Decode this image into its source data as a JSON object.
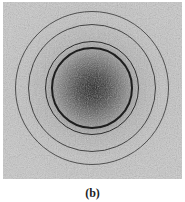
{
  "figure": {
    "panel_label": "(b)",
    "center": {
      "x": 92,
      "y": 88
    },
    "rings": [
      {
        "name": "ring-1",
        "radius": 41,
        "width": 2.2,
        "color": "#1e1e1e"
      },
      {
        "name": "ring-2",
        "radius": 47,
        "width": 1.6,
        "color": "#2e2e2e"
      },
      {
        "name": "ring-3",
        "radius": 64,
        "width": 1.3,
        "color": "#444444"
      },
      {
        "name": "ring-4",
        "radius": 77,
        "width": 1.2,
        "color": "#505050"
      }
    ]
  }
}
